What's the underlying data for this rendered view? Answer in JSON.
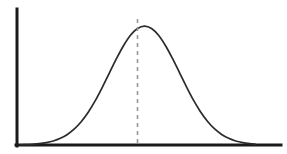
{
  "figure": {
    "width": 287,
    "height": 154,
    "background_color": "#ffffff",
    "title": "",
    "caption": ""
  },
  "style": {
    "axis_color": "#1a1a1a",
    "curve_color": "#2b2b2b",
    "mean_line_color": "#9a9a9a",
    "axis_width": 3,
    "curve_width": 1.7,
    "mean_line_width": 1.6,
    "mean_line_dash": "4 4"
  },
  "axes": {
    "y_axis": {
      "name": "y-axis",
      "x": 17,
      "y_top": 9,
      "y_bottom": 146,
      "label": "",
      "ticks": [],
      "tick_labels": []
    },
    "x_axis": {
      "name": "x-axis",
      "y": 145,
      "x_left": 16,
      "x_right": 281,
      "label": "",
      "ticks": [],
      "tick_labels": []
    }
  },
  "annotations": [
    {
      "name": "mean-line",
      "type": "vertical-dashed-line",
      "x": 137.5,
      "y_top": 19,
      "y_bottom": 145,
      "label": "",
      "color": "#9a9a9a"
    }
  ],
  "chart_data": {
    "type": "line",
    "title": "",
    "subtitle": "",
    "xlabel": "",
    "ylabel": "",
    "grid": false,
    "legend": null,
    "legend_position": "none",
    "distribution": "normal",
    "mean": 0,
    "std_dev": 1,
    "xlim": [
      -3.55,
      3.15
    ],
    "ylim": [
      0,
      1.06
    ],
    "annotations": [
      {
        "type": "vline",
        "x": 0,
        "style": "dashed",
        "color": "#9a9a9a",
        "label": ""
      }
    ],
    "series": [
      {
        "name": "normal-distribution-curve",
        "x": [
          -3.55,
          -3.4,
          -3.2,
          -3.0,
          -2.8,
          -2.6,
          -2.4,
          -2.2,
          -2.0,
          -1.8,
          -1.6,
          -1.4,
          -1.2,
          -1.0,
          -0.8,
          -0.6,
          -0.4,
          -0.2,
          0.0,
          0.2,
          0.4,
          0.6,
          0.8,
          1.0,
          1.2,
          1.4,
          1.6,
          1.8,
          2.0,
          2.2,
          2.4,
          2.6,
          2.8,
          3.0,
          3.15
        ],
        "y": [
          0.002,
          0.003,
          0.006,
          0.011,
          0.02,
          0.034,
          0.056,
          0.089,
          0.135,
          0.198,
          0.278,
          0.375,
          0.487,
          0.607,
          0.726,
          0.835,
          0.923,
          0.98,
          1.0,
          0.98,
          0.923,
          0.835,
          0.726,
          0.607,
          0.487,
          0.375,
          0.278,
          0.198,
          0.135,
          0.089,
          0.056,
          0.034,
          0.02,
          0.011,
          0.007
        ]
      }
    ],
    "pixel_geometry": {
      "peak_x": 137.5,
      "peak_y": 19,
      "baseline_y": 145,
      "left_tail_x": 33,
      "right_tail_x": 245,
      "half_max_left_x": 76,
      "half_max_right_x": 199
    }
  }
}
